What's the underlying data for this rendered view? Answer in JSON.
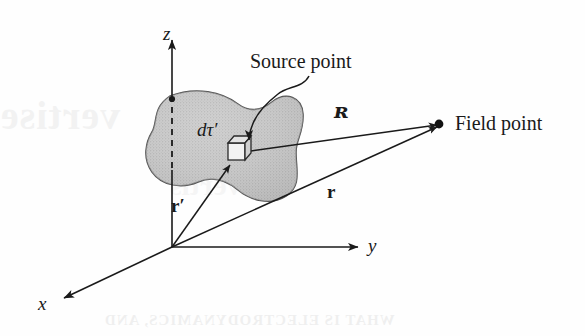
{
  "figure": {
    "kind": "physics-vector-diagram",
    "caption_labels": {
      "source_point": "Source point",
      "field_point": "Field point",
      "volume_element": "dτ′"
    },
    "axes": {
      "x_label": "x",
      "y_label": "y",
      "z_label": "z",
      "origin_label": ""
    },
    "vectors": [
      {
        "name": "separation-vector",
        "symbol": "ʀ",
        "from": "source point",
        "to": "field point"
      },
      {
        "name": "field-position-vector",
        "symbol": "r",
        "from": "origin",
        "to": "field point"
      },
      {
        "name": "source-position-vector",
        "symbol": "r′",
        "from": "origin",
        "to": "source point"
      }
    ],
    "ghost_text": {
      "left": "vertise",
      "bottom": "WHAT IS ELECTRODYNAMICS, AND",
      "middle": "Advertis"
    },
    "colors": {
      "ink": "#1a1a1a",
      "blob_fill": "#c9c9c9",
      "blob_edge": "#555555",
      "background": "#fefefe"
    }
  }
}
